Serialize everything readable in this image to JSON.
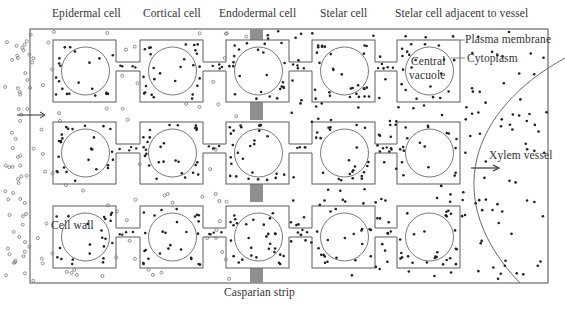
{
  "diagram": {
    "type": "plant root cross-section: symplastic and apoplastic water/solute transport",
    "column_labels": [
      {
        "id": "epidermal",
        "text": "Epidermal cell"
      },
      {
        "id": "cortical",
        "text": "Cortical cell"
      },
      {
        "id": "endodermal",
        "text": "Endodermal cell"
      },
      {
        "id": "stelar",
        "text": "Stelar cell"
      },
      {
        "id": "stelar-adjacent",
        "text": "Stelar cell adjacent to vessel"
      }
    ],
    "annotations": {
      "plasma_membrane": "Plasma membrane",
      "cytoplasm": "Cytoplasm",
      "central_vacuole_line1": "Central",
      "central_vacuole_line2": "vacuole",
      "cell_wall": "Cell wall",
      "xylem_vessel": "Xylem vessel",
      "casparian_strip": "Casparian strip"
    },
    "legend": {
      "open_circle": "solute in apoplast (outside Casparian strip)",
      "filled_dot": "solute molecules"
    },
    "grid": {
      "rows": 3,
      "columns": 5
    },
    "colors": {
      "line": "#6a6a6a",
      "casparian_strip": "#8f8f8f",
      "dot": "#222222",
      "open_circle": "#777777",
      "text": "#333333"
    }
  }
}
